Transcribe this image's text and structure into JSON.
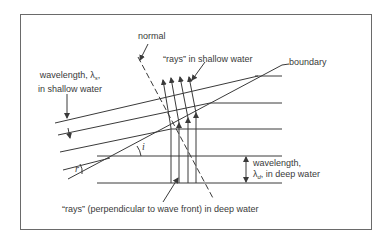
{
  "diagram": {
    "labels": {
      "normal": "normal",
      "rays_shallow": "“rays” in shallow water",
      "boundary": "boundary",
      "wavelength_shallow_line1": "wavelength, λ",
      "wavelength_shallow_sub": "s",
      "wavelength_shallow_comma": ",",
      "wavelength_shallow_line2": "in shallow water",
      "angle_i": "i",
      "angle_r": "r",
      "wavelength_deep_line1": "wavelength,",
      "wavelength_deep_lambda": "λ",
      "wavelength_deep_sub": "d",
      "wavelength_deep_rest": ", in deep water",
      "rays_deep": "“rays” (perpendicular to wave front) in deep water"
    },
    "colors": {
      "line": "#3a3a3a",
      "frame": "#6a6a6a",
      "background": "#ffffff"
    }
  }
}
